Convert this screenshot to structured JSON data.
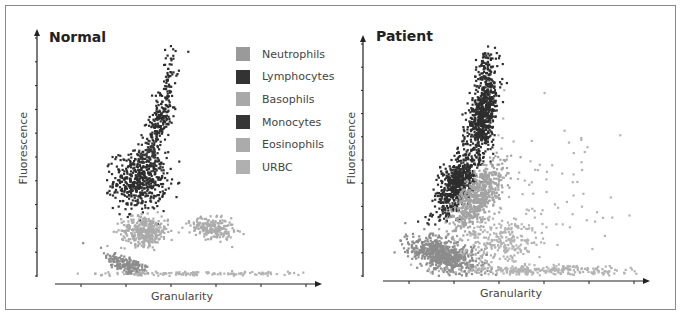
{
  "chart_data": [
    {
      "type": "scatter",
      "title": "Normal",
      "xlabel": "Granularity",
      "ylabel": "Fluorescence",
      "xlim": [
        0,
        10
      ],
      "ylim": [
        0,
        10
      ],
      "x_ticks": 6,
      "y_ticks": 10,
      "tick_labels": "none",
      "grid": false,
      "legend_position": "upper right (inside)",
      "series": [
        {
          "name": "Neutrophils",
          "color": "#8c8c8c",
          "clusters": [
            {
              "cx": 2.7,
              "cy": 0.45,
              "rx": 0.9,
              "ry": 0.35,
              "angle": -25,
              "n": 180
            }
          ]
        },
        {
          "name": "Lymphocytes",
          "color": "#2e2e2e",
          "clusters": [
            {
              "cx": 3.2,
              "cy": 4.0,
              "rx": 0.95,
              "ry": 1.1,
              "angle": 0,
              "n": 520
            },
            {
              "cx": 4.0,
              "cy": 6.6,
              "rx": 0.4,
              "ry": 1.6,
              "angle": -15,
              "n": 220
            },
            {
              "cx": 4.4,
              "cy": 8.8,
              "rx": 0.25,
              "ry": 0.9,
              "angle": -10,
              "n": 30
            }
          ]
        },
        {
          "name": "Basophils",
          "color": "#a3a3a3",
          "clusters": [
            {
              "cx": 3.5,
              "cy": 1.6,
              "rx": 0.15,
              "ry": 0.3,
              "angle": 0,
              "n": 20
            }
          ]
        },
        {
          "name": "Monocytes",
          "color": "#3a3a3a",
          "clusters": [
            {
              "cx": 3.6,
              "cy": 5.2,
              "rx": 0.25,
              "ry": 0.5,
              "angle": 0,
              "n": 40
            }
          ]
        },
        {
          "name": "Eosinophils",
          "color": "#ababab",
          "clusters": [
            {
              "cx": 3.4,
              "cy": 1.9,
              "rx": 0.85,
              "ry": 0.55,
              "angle": 0,
              "n": 360
            },
            {
              "cx": 6.1,
              "cy": 2.0,
              "rx": 0.8,
              "ry": 0.4,
              "angle": -10,
              "n": 220
            }
          ]
        },
        {
          "name": "URBC",
          "color": "#b3b3b3",
          "clusters": [
            {
              "cx": 5.5,
              "cy": 0.1,
              "rx": 4.0,
              "ry": 0.08,
              "angle": 0,
              "n": 140
            }
          ]
        }
      ]
    },
    {
      "type": "scatter",
      "title": "Patient",
      "xlabel": "Granularity",
      "ylabel": "Fluorescence",
      "xlim": [
        0,
        10
      ],
      "ylim": [
        0,
        10
      ],
      "x_ticks": 6,
      "y_ticks": 10,
      "tick_labels": "none",
      "grid": false,
      "series": [
        {
          "name": "Neutrophils",
          "color": "#8c8c8c",
          "clusters": [
            {
              "cx": 2.2,
              "cy": 0.9,
              "rx": 1.3,
              "ry": 0.6,
              "angle": -20,
              "n": 700
            }
          ]
        },
        {
          "name": "Lymphocytes",
          "color": "#2e2e2e",
          "clusters": [
            {
              "cx": 2.8,
              "cy": 4.0,
              "rx": 0.6,
              "ry": 1.4,
              "angle": -25,
              "n": 650
            },
            {
              "cx": 3.8,
              "cy": 6.9,
              "rx": 0.5,
              "ry": 1.7,
              "angle": -10,
              "n": 650
            },
            {
              "cx": 3.9,
              "cy": 9.0,
              "rx": 0.35,
              "ry": 0.8,
              "angle": 0,
              "n": 70
            }
          ]
        },
        {
          "name": "Eosinophils",
          "color": "#a3a3a3",
          "clusters": [
            {
              "cx": 3.6,
              "cy": 3.4,
              "rx": 0.6,
              "ry": 1.5,
              "angle": -30,
              "n": 650
            }
          ]
        },
        {
          "name": "URBC",
          "color": "#b3b3b3",
          "clusters": [
            {
              "cx": 4.5,
              "cy": 1.5,
              "rx": 1.4,
              "ry": 1.0,
              "angle": 0,
              "n": 260
            },
            {
              "cx": 6.0,
              "cy": 0.25,
              "rx": 3.5,
              "ry": 0.2,
              "angle": 0,
              "n": 260
            },
            {
              "cx": 6.5,
              "cy": 4.0,
              "rx": 2.5,
              "ry": 3.0,
              "angle": 0,
              "n": 70
            }
          ]
        }
      ]
    }
  ],
  "panels": {
    "normal": {
      "title": "Normal",
      "xlabel": "Granularity",
      "ylabel": "Fluorescence"
    },
    "patient": {
      "title": "Patient",
      "xlabel": "Granularity",
      "ylabel": "Fluorescence"
    }
  },
  "legend": {
    "items": [
      {
        "label": "Neutrophils",
        "color": "#9a9a9a"
      },
      {
        "label": "Lymphocytes",
        "color": "#333333"
      },
      {
        "label": "Basophils",
        "color": "#a8a8a8"
      },
      {
        "label": "Monocytes",
        "color": "#363636"
      },
      {
        "label": "Eosinophils",
        "color": "#ababab"
      },
      {
        "label": "URBC",
        "color": "#b0b0b0"
      }
    ]
  },
  "colors": {
    "border": "#8a8a8a",
    "axis": "#222222"
  }
}
